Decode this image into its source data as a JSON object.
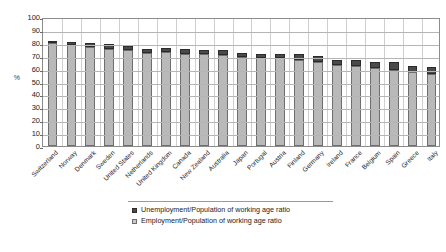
{
  "chart_data": {
    "type": "bar",
    "stacked": true,
    "title": "",
    "xlabel": "",
    "ylabel": "%",
    "ylim": [
      0,
      100
    ],
    "ytick_step": 10,
    "yticks": [
      100,
      90,
      80,
      70,
      60,
      50,
      40,
      30,
      20,
      10,
      0
    ],
    "grid": true,
    "legend_position": "bottom",
    "categories": [
      "Switzerland",
      "Norway",
      "Denmark",
      "Sweden",
      "United States",
      "Netherlands",
      "United Kingdom",
      "Canada",
      "New Zealand",
      "Australia",
      "Japan",
      "Portugal",
      "Austria",
      "Finland",
      "Germany",
      "Ireland",
      "France",
      "Belgium",
      "Spain",
      "Greece",
      "Italy"
    ],
    "series": [
      {
        "name": "Employment/Population of working age ratio",
        "color": "#b9b9b9",
        "values": [
          79.5,
          78.5,
          76.5,
          75.5,
          74.5,
          72.0,
          72.5,
          71.5,
          71.0,
          70.5,
          69.0,
          68.0,
          68.0,
          67.0,
          65.5,
          63.0,
          62.0,
          60.5,
          59.0,
          57.0,
          56.0
        ]
      },
      {
        "name": "Unemployment/Population of working age ratio",
        "color": "#4a4a4a",
        "values": [
          2.3,
          2.4,
          3.0,
          3.3,
          3.4,
          3.5,
          3.2,
          3.5,
          3.3,
          3.6,
          3.3,
          3.5,
          3.3,
          4.6,
          4.5,
          3.7,
          5.0,
          4.3,
          6.3,
          5.2,
          5.0
        ]
      }
    ],
    "legend_entries": [
      "Unemployment/Population of working age ratio",
      "Employment/Population of working age ratio"
    ]
  },
  "axis": {
    "y_title": "%"
  }
}
